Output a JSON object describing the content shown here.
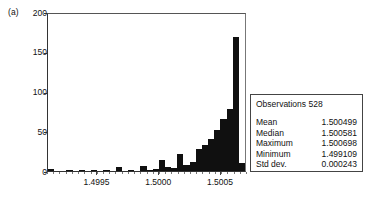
{
  "figure": {
    "panel_label": "(a)"
  },
  "chart_data": {
    "type": "bar",
    "title": "",
    "xlabel": "",
    "ylabel": "",
    "ylim": [
      0,
      200
    ],
    "yticks": [
      0,
      50,
      100,
      150,
      200
    ],
    "ytick_labels": [
      "0",
      "50",
      "100",
      "150",
      "200"
    ],
    "xlim": [
      1.4991,
      1.50071
    ],
    "xticks": [
      1.4995,
      1.5,
      1.5005
    ],
    "xtick_labels": [
      "1.4995",
      "1.5000",
      "1.5005"
    ],
    "grid": false,
    "legend": "none",
    "bar_color": "#101010",
    "n_bins": 32,
    "categories": [
      "1.49910",
      "1.49915",
      "1.49920",
      "1.49925",
      "1.49930",
      "1.49935",
      "1.49940",
      "1.49945",
      "1.49950",
      "1.49955",
      "1.49960",
      "1.49965",
      "1.49970",
      "1.49975",
      "1.49980",
      "1.49985",
      "1.49990",
      "1.49995",
      "1.50000",
      "1.50005",
      "1.50010",
      "1.50015",
      "1.50020",
      "1.50025",
      "1.50030",
      "1.50035",
      "1.50040",
      "1.50045",
      "1.50050",
      "1.50055",
      "1.50060",
      "1.50065"
    ],
    "values": [
      2,
      0,
      0,
      1,
      0,
      1,
      0,
      1,
      0,
      1,
      0,
      5,
      0,
      1,
      0,
      6,
      1,
      3,
      14,
      5,
      4,
      22,
      7,
      11,
      28,
      33,
      40,
      52,
      66,
      78,
      168,
      10
    ]
  },
  "stats": {
    "observations_label": "Observations",
    "observations_value": "528",
    "rows": [
      {
        "label": "Mean",
        "value": "1.500499"
      },
      {
        "label": "Median",
        "value": "1.500581"
      },
      {
        "label": "Maximum",
        "value": "1.500698"
      },
      {
        "label": "Minimum",
        "value": "1.499109"
      },
      {
        "label": "Std dev.",
        "value": "0.000243"
      }
    ]
  }
}
